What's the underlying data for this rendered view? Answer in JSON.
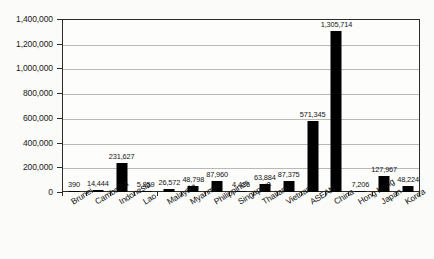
{
  "chart_data": {
    "type": "bar",
    "title": "",
    "xlabel": "",
    "ylabel": "",
    "ylim": [
      0,
      1400000
    ],
    "grid": true,
    "legend": "none",
    "orientation": "vertical",
    "bar_color": "#000000",
    "categories": [
      "Brunei",
      "Cambodia",
      "Indonesia",
      "Lao",
      "Malaysia",
      "Myanmar",
      "Philippines",
      "Singapore",
      "Thailand",
      "Vietnam",
      "ASEAN",
      "China",
      "Hong Kong",
      "Japan",
      "Korea"
    ],
    "values": [
      390,
      14444,
      231627,
      5859,
      26572,
      48798,
      87960,
      4436,
      63884,
      87375,
      571345,
      1305714,
      7206,
      127967,
      48224
    ],
    "value_labels": [
      "390",
      "14,444",
      "231,627",
      "5,859",
      "26,572",
      "48,798",
      "87,960",
      "4,436",
      "63,884",
      "87,375",
      "571,345",
      "1,305,714",
      "7,206",
      "127,967",
      "48,224"
    ],
    "ytick_values": [
      0,
      200000,
      400000,
      600000,
      800000,
      1000000,
      1200000,
      1400000
    ],
    "ytick_labels": [
      "0",
      "200,000",
      "400,000",
      "600,000",
      "800,000",
      "1,000,000",
      "1,200,000",
      "1,400,000"
    ]
  },
  "colors": {
    "bar": "#000000",
    "grid": "#b9b9b9",
    "axis": "#2b2b2b",
    "background": "#fbfbf9",
    "text": "#101010"
  }
}
